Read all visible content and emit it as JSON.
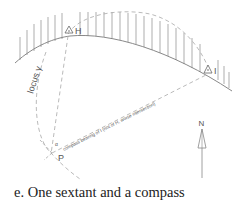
{
  "figure": {
    "caption": "e. One sextant and a compass",
    "labels": {
      "landmark_h": "H",
      "landmark_i": "I",
      "position_p": "P",
      "locus": "locus γ",
      "bearing_line": "compass bearing of I (not of H, worse intersection)",
      "north": "N",
      "angle_mark": "α"
    }
  },
  "colors": {
    "line": "#8a8a8a",
    "dashed": "#a8a8a8",
    "text": "#555555",
    "caption": "#222222"
  }
}
